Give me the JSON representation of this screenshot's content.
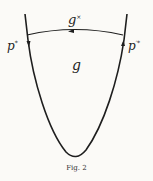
{
  "figure": {
    "caption": "Fig. 2",
    "labels": {
      "top_arc": {
        "base": "g",
        "sup": "×"
      },
      "interior": {
        "base": "g"
      },
      "left": {
        "base": "p",
        "sup": "*"
      },
      "right": {
        "base": "p",
        "sup": "′*"
      }
    },
    "colors": {
      "ink": "#1e1e1e",
      "paper": "#fbfaf7"
    }
  }
}
